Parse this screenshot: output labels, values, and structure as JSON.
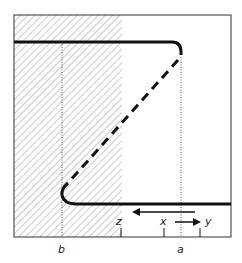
{
  "diagram": {
    "labels": {
      "b": "b",
      "a": "a",
      "z": "z",
      "x": "x",
      "y": "y"
    },
    "colors": {
      "stroke": "#111111",
      "hatch": "#9a9a9a",
      "frame": "#333333"
    },
    "elements": {
      "hatched_region": "shaded-region-left",
      "solid_path": "thick-path-top-and-bottom",
      "dashed_path": "diagonal-dashed-connector",
      "arrow_left": "leftward-arrow",
      "arrow_right": "rightward-arrow"
    }
  }
}
